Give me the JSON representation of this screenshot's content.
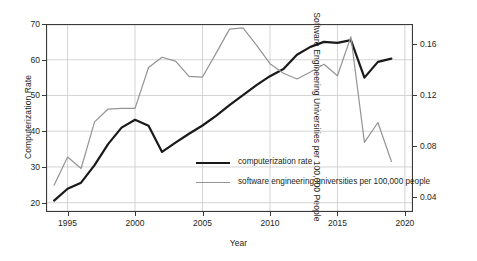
{
  "chart_data": {
    "type": "line",
    "title": "",
    "xlabel": "Year",
    "ylabel": "Computerization Rate",
    "ylabel_right": "Software Engineering Universities per 100,000 People",
    "grid": true,
    "legend_position": "center",
    "xlim": [
      1993.4,
      2020.6
    ],
    "ylim": [
      17.4,
      70.0
    ],
    "ylim_right": [
      0.0285,
      0.1755
    ],
    "xticks": [
      "1995",
      "2000",
      "2005",
      "2010",
      "2015",
      "2020"
    ],
    "xtick_values": [
      1995,
      2000,
      2005,
      2010,
      2015,
      2020
    ],
    "yticks": [
      "20",
      "30",
      "40",
      "50",
      "60",
      "70"
    ],
    "ytick_values": [
      20,
      30,
      40,
      50,
      60,
      70
    ],
    "yticks_right": [
      "0.04",
      "0.08",
      "0.12",
      "0.16"
    ],
    "ytick_values_right": [
      0.04,
      0.08,
      0.12,
      0.16
    ],
    "x": [
      1994,
      1995,
      1996,
      1997,
      1998,
      1999,
      2000,
      2001,
      2002,
      2003,
      2004,
      2005,
      2006,
      2007,
      2008,
      2009,
      2010,
      2011,
      2012,
      2013,
      2014,
      2015,
      2016,
      2017,
      2018,
      2019
    ],
    "series": [
      {
        "name": "computerization rate",
        "axis": "left",
        "color": "#1a1a1a",
        "width": 2.2,
        "values": [
          20.6,
          23.9,
          25.6,
          30.5,
          36.4,
          41.0,
          43.2,
          41.5,
          34.2,
          36.8,
          39.3,
          41.6,
          44.3,
          47.3,
          50.1,
          52.9,
          55.4,
          57.4,
          61.4,
          63.6,
          65.0,
          64.7,
          65.5,
          55.0,
          59.4,
          60.3
        ]
      },
      {
        "name": "software engineering universities per 100,000 people",
        "axis": "right",
        "color": "#949494",
        "width": 1.2,
        "values": [
          0.0495,
          0.0715,
          0.0625,
          0.099,
          0.109,
          0.1095,
          0.1095,
          0.1415,
          0.1495,
          0.1465,
          0.1345,
          0.134,
          0.1525,
          0.1715,
          0.1725,
          0.159,
          0.1445,
          0.137,
          0.1325,
          0.138,
          0.144,
          0.135,
          0.1655,
          0.083,
          0.0985,
          0.068
        ]
      }
    ],
    "legend": [
      {
        "label": "computerization rate",
        "color": "#1a1a1a",
        "width": 2.2
      },
      {
        "label": "software engineering universities per 100,000 people",
        "color": "#949494",
        "width": 1.2
      }
    ]
  }
}
